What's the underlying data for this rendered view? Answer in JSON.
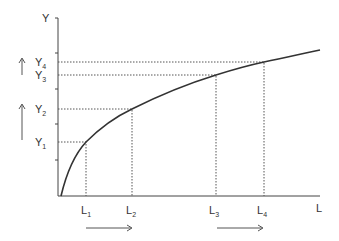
{
  "diagram": {
    "type": "concave-production-curve",
    "colors": {
      "ink": "#333333",
      "dash": "#555555"
    },
    "axes": {
      "y_label": "Y",
      "x_label": "L"
    },
    "y_levels": [
      {
        "name": "Y",
        "sub": "1"
      },
      {
        "name": "Y",
        "sub": "2"
      },
      {
        "name": "Y",
        "sub": "3"
      },
      {
        "name": "Y",
        "sub": "4"
      }
    ],
    "x_levels": [
      {
        "name": "L",
        "sub": "1"
      },
      {
        "name": "L",
        "sub": "2"
      },
      {
        "name": "L",
        "sub": "3"
      },
      {
        "name": "L",
        "sub": "4"
      }
    ],
    "arrows": {
      "vertical": [
        "up (Y1 to Y2)",
        "up (Y3 to Y4)"
      ],
      "horizontal": [
        "right (L1 to L2)",
        "right (L3 to L4)"
      ]
    }
  }
}
